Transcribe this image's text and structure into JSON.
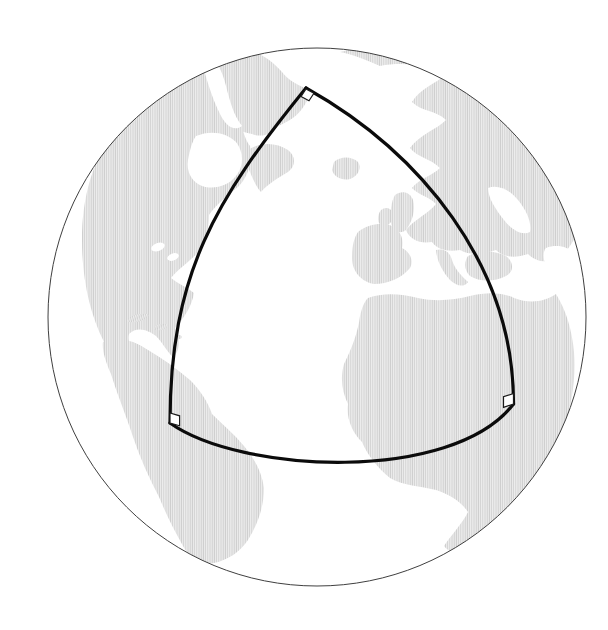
{
  "figure": {
    "type": "globe-spherical-triangle-diagram",
    "background_color": "#ffffff",
    "globe": {
      "cx": 317,
      "cy": 317,
      "r": 269,
      "outline_color": "#3f3f3f",
      "outline_width": 1,
      "ocean_color": "#ffffff"
    },
    "land": {
      "stripe_period": 2.2,
      "stripe_height": 6,
      "stripe_color": "#cfcfcf",
      "stripe_bg_color": "#f1f1f1",
      "stripe_width": 1.1,
      "sea_overlay_color": "#ffffff"
    },
    "triangle": {
      "stroke_color": "#0b0b0b",
      "stroke_width": 3.2,
      "edges": {
        "left": "M 306,88 C 215,200 170,274 170,423",
        "right": "M 306,88 C 420,152 514,265 513.5,404",
        "bottom": "M 170,423 C 240,473 452,484 513.5,404"
      },
      "vertices": [
        {
          "x": 306,
          "y": 88
        },
        {
          "x": 170,
          "y": 423
        },
        {
          "x": 513.5,
          "y": 404
        }
      ],
      "right_angle_markers": {
        "fill": "#ffffff",
        "stroke": "#1a1a1a",
        "stroke_width": 1.2,
        "apex_points": "306,89 301.1,96.5 309,100.8 313.9,93.3",
        "west_points": "170,423 170,413 179.6,415.8 179.6,425.8",
        "east_points": "513.5,404 513.5,393.5 503.5,396.8 503.5,407.3"
      }
    }
  }
}
